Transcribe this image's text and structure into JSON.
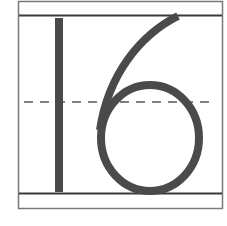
{
  "worksheet": {
    "numeral": "16",
    "digits": [
      "1",
      "6"
    ],
    "guide_lines": {
      "top": "solid",
      "midline": "dashed",
      "baseline": "solid"
    },
    "colors": {
      "stroke": "#4a4a4a",
      "frame": "#6e6e6e",
      "background": "#ffffff"
    }
  }
}
